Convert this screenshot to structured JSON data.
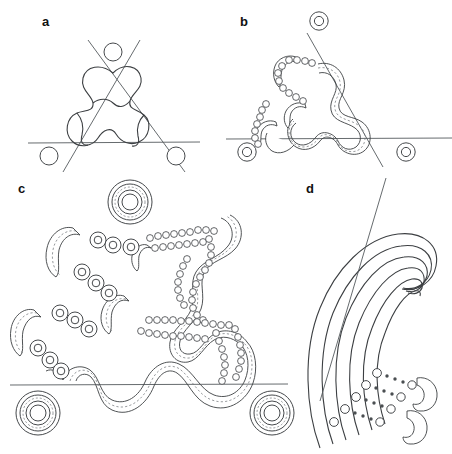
{
  "figure": {
    "type": "scientific-line-diagram",
    "width": 452,
    "height": 454,
    "background_color": "#ffffff",
    "stroke_color": "#3c3f42",
    "light_stroke_color": "#6a6f73",
    "line_color": "#555a5e",
    "panels": [
      {
        "id": "a",
        "label": "a",
        "label_x": 42,
        "label_y": 26,
        "description": "Thin-line trefoil-like closed wavy curve with three straight secant lines and three small open circles",
        "elements": {
          "closed_curve": "three-fold symmetric wavy closed loop",
          "straight_lines": 3,
          "circles": 3,
          "circle_radius": 9,
          "circle_positions": [
            [
              113,
              52
            ],
            [
              49,
              156
            ],
            [
              176,
              156
            ]
          ]
        }
      },
      {
        "id": "b",
        "label": "b",
        "label_x": 240,
        "label_y": 26,
        "description": "Same curve rendered as a dashed-core tube on the right half, dissolving into a chain of ring beads on the left; three double-ring tori and three straight lines",
        "elements": {
          "tube_width": 9,
          "torus_count": 3,
          "torus_outer_radius": 9,
          "torus_inner_radius": 4.6,
          "torus_positions": [
            [
              319,
              21
            ],
            [
              247,
              152
            ],
            [
              406,
              152
            ]
          ],
          "bead_chain": "ring beads tracing the left lobe",
          "straight_lines": 3
        }
      },
      {
        "id": "c",
        "label": "c",
        "label_x": 18,
        "label_y": 193,
        "description": "Enlarged version: lower tube intact with dashed core, upper-left arm broken into large tori and short tube fragments, upper-right arm dissolved into chains of tiny rings; one horizontal line and three large concentric tori",
        "elements": {
          "tube_width": 13,
          "large_torus_positions": [
            [
              130,
              202
            ],
            [
              38,
              413
            ],
            [
              272,
              413
            ]
          ],
          "large_torus_outer_radius": 22,
          "medium_bead_radius": 8,
          "tiny_bead_radius": 3.4,
          "horizontal_line_y": 385
        }
      },
      {
        "id": "d",
        "label": "d",
        "label_x": 306,
        "label_y": 193,
        "description": "Six nested C-shaped arcs swinging from lower-left up and around to the right; lower ends terminate in small circles followed by dotted trails ending in two hook shapes; one straight diagonal line crosses the nest",
        "elements": {
          "nested_arc_count": 6,
          "diagonal_lines": 1,
          "terminal_circle_radius": 4.4,
          "dot_radius": 1.7,
          "hook_count": 2
        }
      }
    ]
  }
}
